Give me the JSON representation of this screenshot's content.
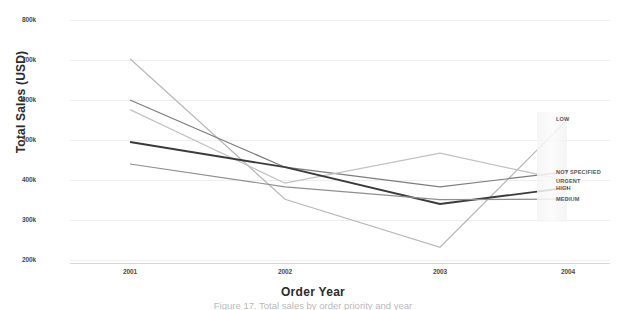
{
  "chart_data": {
    "type": "line",
    "title": "",
    "xlabel": "Order Year",
    "ylabel": "Total Sales (USD)",
    "x": [
      "2001",
      "2002",
      "2003",
      "2004"
    ],
    "xtick_labels": [
      "2001",
      "2002",
      "2003",
      "2004"
    ],
    "ytick_labels": [
      "800k",
      "700k",
      "600k",
      "500k",
      "400k",
      "300k",
      "200k"
    ],
    "ytick_values": [
      800000,
      700000,
      600000,
      500000,
      400000,
      300000,
      200000
    ],
    "ylim": [
      200000,
      800000
    ],
    "grid": true,
    "legend_position": "right",
    "series": [
      {
        "name": "LOW",
        "values": [
          703000,
          352000,
          232000,
          552000
        ],
        "color": "#b8b8b8"
      },
      {
        "name": "NOT SPECIFIED",
        "values": [
          600000,
          432000,
          383000,
          421000
        ],
        "color": "#7d7d7d"
      },
      {
        "name": "URGENT",
        "values": [
          576000,
          392000,
          467000,
          398000
        ],
        "color": "#c2c2c2"
      },
      {
        "name": "HIGH",
        "values": [
          495000,
          432000,
          340000,
          381000
        ],
        "color": "#3a3a3a"
      },
      {
        "name": "MEDIUM",
        "values": [
          440000,
          383000,
          351000,
          352000
        ],
        "color": "#8f8f8f"
      }
    ]
  },
  "axes": {
    "y_title": "Total Sales (USD)",
    "x_title": "Order Year"
  },
  "caption": {
    "text": "Figure 17. Total sales by order priority and year"
  },
  "legend": {
    "items": [
      {
        "label": "LOW"
      },
      {
        "label": "NOT SPECIFIED"
      },
      {
        "label": "URGENT"
      },
      {
        "label": "HIGH"
      },
      {
        "label": "MEDIUM"
      }
    ]
  }
}
